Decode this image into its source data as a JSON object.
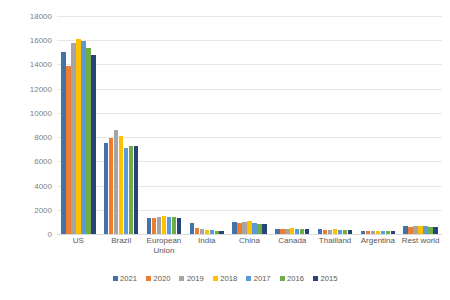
{
  "chart_data": {
    "type": "bar",
    "title": "",
    "subtitle": "",
    "xlabel": "",
    "ylabel": "Bioethanol production (Millions of gallons per year)",
    "ylim": [
      0,
      18000
    ],
    "ytick_step": 2000,
    "yticks": [
      0,
      2000,
      4000,
      6000,
      8000,
      10000,
      12000,
      14000,
      16000,
      18000
    ],
    "ytick_labels": [
      "0",
      "2000",
      "4000",
      "6000",
      "8000",
      "10000",
      "12000",
      "14000",
      "16000",
      "18000"
    ],
    "grid": true,
    "legend_position": "bottom",
    "categories": [
      "US",
      "Brazil",
      "European Union",
      "India",
      "China",
      "Canada",
      "Thailland",
      "Argentina",
      "Rest world"
    ],
    "series": [
      {
        "name": "2021",
        "color": "#4472a8",
        "values": [
          15000,
          7500,
          1350,
          900,
          1000,
          450,
          380,
          270,
          700
        ]
      },
      {
        "name": "2020",
        "color": "#ed7d31",
        "values": [
          13900,
          7900,
          1300,
          500,
          880,
          400,
          340,
          250,
          620
        ]
      },
      {
        "name": "2019",
        "color": "#a5a5a5",
        "values": [
          15750,
          8600,
          1400,
          380,
          1000,
          420,
          360,
          260,
          640
        ]
      },
      {
        "name": "2018",
        "color": "#ffc000",
        "values": [
          16100,
          8100,
          1450,
          330,
          1050,
          460,
          380,
          270,
          660
        ]
      },
      {
        "name": "2017",
        "color": "#5b9bd5",
        "values": [
          15900,
          7100,
          1400,
          300,
          900,
          450,
          360,
          260,
          640
        ]
      },
      {
        "name": "2016",
        "color": "#70ad47",
        "values": [
          15400,
          7300,
          1380,
          280,
          820,
          420,
          330,
          240,
          610
        ]
      },
      {
        "name": "2015",
        "color": "#264478",
        "values": [
          14750,
          7250,
          1350,
          270,
          800,
          400,
          320,
          230,
          600
        ]
      }
    ]
  }
}
